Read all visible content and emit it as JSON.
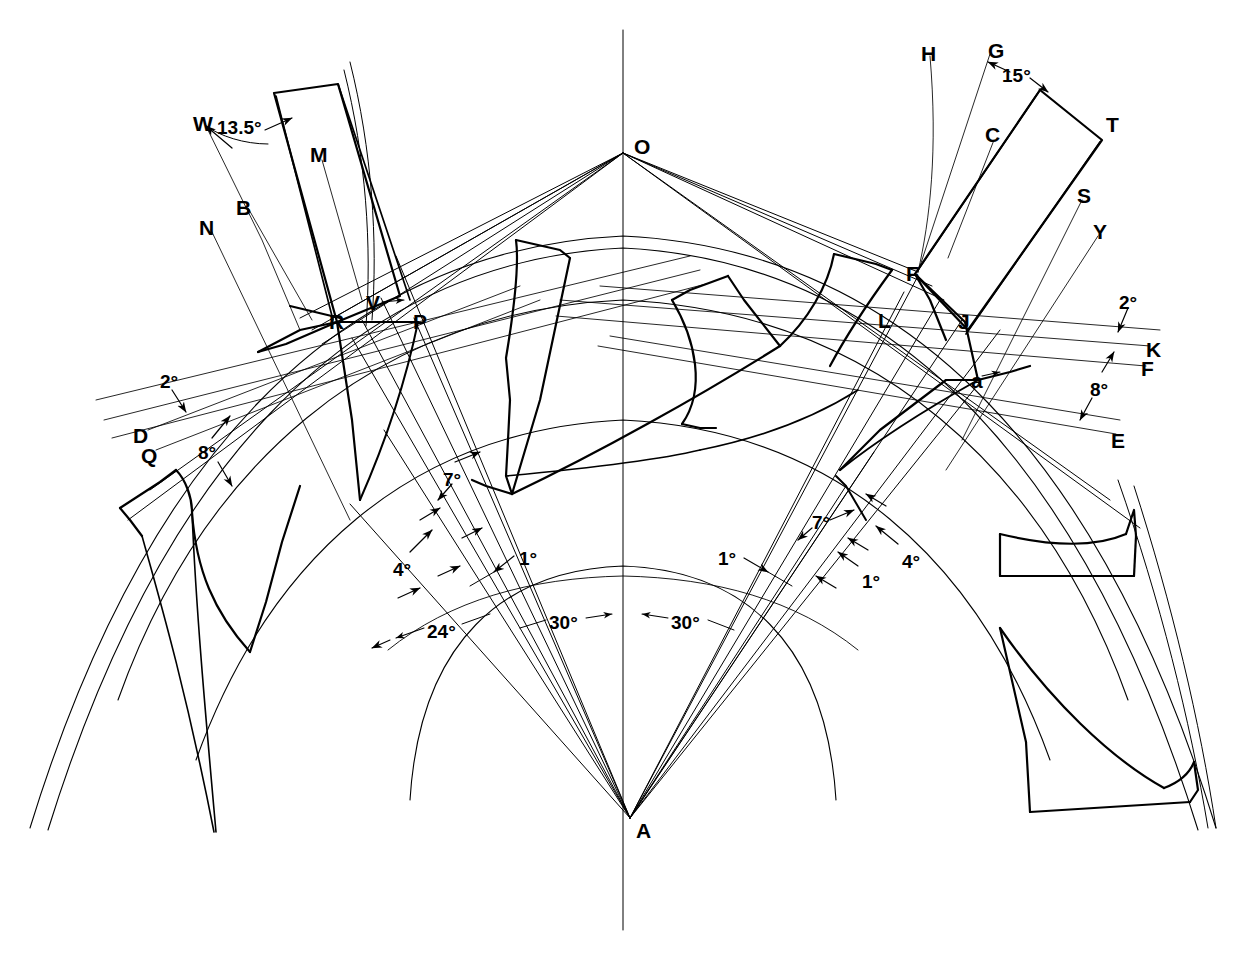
{
  "diagram": {
    "type": "engineering-line-drawing",
    "stroke_color": "#000000",
    "background_color": "#ffffff",
    "width": 1243,
    "height": 960
  },
  "point_labels": [
    {
      "id": "O",
      "text": "O",
      "x": 634,
      "y": 136
    },
    {
      "id": "A",
      "text": "A",
      "x": 636,
      "y": 820
    },
    {
      "id": "W",
      "text": "W",
      "x": 193,
      "y": 113
    },
    {
      "id": "M",
      "text": "M",
      "x": 310,
      "y": 144
    },
    {
      "id": "B",
      "text": "B",
      "x": 236,
      "y": 197
    },
    {
      "id": "N",
      "text": "N",
      "x": 199,
      "y": 217
    },
    {
      "id": "V",
      "text": "V",
      "x": 366,
      "y": 292
    },
    {
      "id": "R",
      "text": "R",
      "x": 329,
      "y": 311
    },
    {
      "id": "P",
      "text": "P",
      "x": 413,
      "y": 311
    },
    {
      "id": "D",
      "text": "D",
      "x": 133,
      "y": 425
    },
    {
      "id": "Q",
      "text": "Q",
      "x": 141,
      "y": 445
    },
    {
      "id": "H",
      "text": "H",
      "x": 921,
      "y": 43
    },
    {
      "id": "G",
      "text": "G",
      "x": 988,
      "y": 40
    },
    {
      "id": "C",
      "text": "C",
      "x": 985,
      "y": 124
    },
    {
      "id": "T",
      "text": "T",
      "x": 1106,
      "y": 114
    },
    {
      "id": "S",
      "text": "S",
      "x": 1077,
      "y": 185
    },
    {
      "id": "Y",
      "text": "Y",
      "x": 1093,
      "y": 221
    },
    {
      "id": "F1",
      "text": "F",
      "x": 906,
      "y": 263
    },
    {
      "id": "L",
      "text": "L",
      "x": 878,
      "y": 310
    },
    {
      "id": "J",
      "text": "J",
      "x": 958,
      "y": 311
    },
    {
      "id": "a",
      "text": "a",
      "x": 971,
      "y": 370
    },
    {
      "id": "K",
      "text": "K",
      "x": 1146,
      "y": 339
    },
    {
      "id": "F2",
      "text": "F",
      "x": 1141,
      "y": 358
    },
    {
      "id": "E",
      "text": "E",
      "x": 1111,
      "y": 430
    }
  ],
  "angle_labels": [
    {
      "id": "ang-13-5",
      "text": "13.5°",
      "x": 217,
      "y": 118
    },
    {
      "id": "ang-15",
      "text": "15°",
      "x": 1002,
      "y": 66
    },
    {
      "id": "ang-2-left",
      "text": "2°",
      "x": 160,
      "y": 372
    },
    {
      "id": "ang-8-left",
      "text": "8°",
      "x": 198,
      "y": 443
    },
    {
      "id": "ang-2-right",
      "text": "2°",
      "x": 1119,
      "y": 293
    },
    {
      "id": "ang-8-right",
      "text": "8°",
      "x": 1090,
      "y": 380
    },
    {
      "id": "ang-7-left",
      "text": "7°",
      "x": 443,
      "y": 470
    },
    {
      "id": "ang-4-left",
      "text": "4°",
      "x": 393,
      "y": 560
    },
    {
      "id": "ang-1-left",
      "text": "1°",
      "x": 519,
      "y": 549
    },
    {
      "id": "ang-24",
      "text": "24°",
      "x": 427,
      "y": 622
    },
    {
      "id": "ang-30-left",
      "text": "30°",
      "x": 549,
      "y": 613
    },
    {
      "id": "ang-30-right",
      "text": "30°",
      "x": 671,
      "y": 613
    },
    {
      "id": "ang-1-r-out",
      "text": "1°",
      "x": 718,
      "y": 549
    },
    {
      "id": "ang-7-right",
      "text": "7°",
      "x": 812,
      "y": 513
    },
    {
      "id": "ang-1-r-in",
      "text": "1°",
      "x": 862,
      "y": 572
    },
    {
      "id": "ang-4-right",
      "text": "4°",
      "x": 902,
      "y": 552
    }
  ],
  "key_geometry": {
    "apex_O": {
      "x": 623,
      "y": 153
    },
    "apex_A": {
      "x": 630,
      "y": 818
    },
    "centerline_x": 623,
    "point_R": {
      "x": 337,
      "y": 322
    },
    "point_P": {
      "x": 418,
      "y": 322
    },
    "point_F": {
      "x": 915,
      "y": 274
    },
    "point_J": {
      "x": 965,
      "y": 322
    },
    "point_a": {
      "x": 978,
      "y": 380
    }
  }
}
